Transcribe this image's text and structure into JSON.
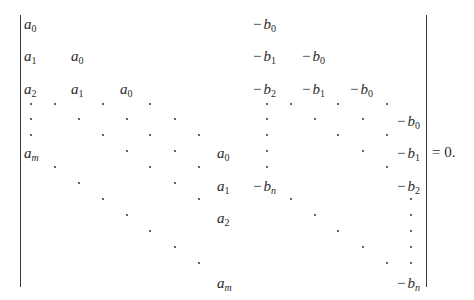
{
  "equation": {
    "type": "determinant",
    "rhs": "= 0.",
    "a_entries": [
      {
        "base": "a",
        "sub": "0",
        "x": 24,
        "y": 17
      },
      {
        "base": "a",
        "sub": "1",
        "x": 24,
        "y": 49
      },
      {
        "base": "a",
        "sub": "0",
        "x": 71,
        "y": 49
      },
      {
        "base": "a",
        "sub": "2",
        "x": 24,
        "y": 82
      },
      {
        "base": "a",
        "sub": "1",
        "x": 71,
        "y": 82
      },
      {
        "base": "a",
        "sub": "0",
        "x": 120,
        "y": 82
      },
      {
        "base": "a",
        "sub": "m",
        "x": 24,
        "y": 146
      },
      {
        "base": "a",
        "sub": "0",
        "x": 217,
        "y": 146
      },
      {
        "base": "a",
        "sub": "1",
        "x": 217,
        "y": 179
      },
      {
        "base": "a",
        "sub": "2",
        "x": 217,
        "y": 211
      },
      {
        "base": "a",
        "sub": "m",
        "x": 217,
        "y": 276
      }
    ],
    "b_entries": [
      {
        "base": "b",
        "sub": "0",
        "x": 253,
        "y": 17
      },
      {
        "base": "b",
        "sub": "1",
        "x": 253,
        "y": 49
      },
      {
        "base": "b",
        "sub": "0",
        "x": 302,
        "y": 49
      },
      {
        "base": "b",
        "sub": "2",
        "x": 253,
        "y": 82
      },
      {
        "base": "b",
        "sub": "1",
        "x": 302,
        "y": 82
      },
      {
        "base": "b",
        "sub": "0",
        "x": 350,
        "y": 82
      },
      {
        "base": "b",
        "sub": "0",
        "x": 397,
        "y": 114
      },
      {
        "base": "b",
        "sub": "1",
        "x": 397,
        "y": 146
      },
      {
        "base": "b",
        "sub": "n",
        "x": 253,
        "y": 179
      },
      {
        "base": "b",
        "sub": "2",
        "x": 397,
        "y": 179
      },
      {
        "base": "b",
        "sub": "n",
        "x": 397,
        "y": 276
      }
    ],
    "dots": [
      [
        30,
        103
      ],
      [
        54,
        103
      ],
      [
        102,
        103
      ],
      [
        149,
        103
      ],
      [
        30,
        118
      ],
      [
        78,
        118
      ],
      [
        126,
        118
      ],
      [
        174,
        118
      ],
      [
        30,
        134
      ],
      [
        102,
        134
      ],
      [
        149,
        134
      ],
      [
        198,
        134
      ],
      [
        126,
        150
      ],
      [
        174,
        150
      ],
      [
        54,
        166
      ],
      [
        149,
        166
      ],
      [
        198,
        166
      ],
      [
        78,
        182
      ],
      [
        174,
        182
      ],
      [
        102,
        198
      ],
      [
        198,
        198
      ],
      [
        126,
        214
      ],
      [
        149,
        230
      ],
      [
        174,
        246
      ],
      [
        198,
        262
      ],
      [
        266,
        103
      ],
      [
        290,
        103
      ],
      [
        337,
        103
      ],
      [
        386,
        103
      ],
      [
        266,
        118
      ],
      [
        314,
        118
      ],
      [
        362,
        118
      ],
      [
        266,
        134
      ],
      [
        337,
        134
      ],
      [
        386,
        134
      ],
      [
        266,
        150
      ],
      [
        362,
        150
      ],
      [
        266,
        166
      ],
      [
        386,
        166
      ],
      [
        290,
        198
      ],
      [
        410,
        198
      ],
      [
        314,
        214
      ],
      [
        410,
        214
      ],
      [
        337,
        230
      ],
      [
        410,
        230
      ],
      [
        362,
        246
      ],
      [
        410,
        246
      ],
      [
        386,
        262
      ],
      [
        410,
        262
      ]
    ],
    "bars": {
      "left": {
        "x": 20,
        "top": 15,
        "bottom": 287
      },
      "right": {
        "x": 426,
        "top": 15,
        "bottom": 287
      }
    },
    "rhs_position": {
      "x": 432,
      "y": 145
    }
  }
}
